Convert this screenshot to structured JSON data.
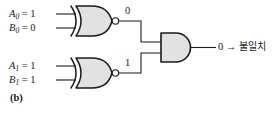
{
  "figure": {
    "panel_label": "(b)",
    "background_color": "#ffffff",
    "line_color": "#1a1a1a",
    "gate_fill_color": "#e2e2e2"
  },
  "gates": [
    {
      "id": "xnor-top",
      "type": "XNOR",
      "inputs": [
        {
          "name": "A0",
          "label_base": "A",
          "label_sub": "0",
          "eq": "=",
          "value": "1"
        },
        {
          "name": "B0",
          "label_base": "B",
          "label_sub": "0",
          "eq": "=",
          "value": "0"
        }
      ],
      "output_value": "0"
    },
    {
      "id": "xnor-bottom",
      "type": "XNOR",
      "inputs": [
        {
          "name": "A1",
          "label_base": "A",
          "label_sub": "1",
          "eq": "=",
          "value": "1"
        },
        {
          "name": "B1",
          "label_base": "B",
          "label_sub": "1",
          "eq": "=",
          "value": "1"
        }
      ],
      "output_value": "1"
    },
    {
      "id": "and-out",
      "type": "AND",
      "output_value": "0",
      "output_arrow": "→",
      "output_annotation": "불일치"
    }
  ],
  "labels": {
    "in_a0": "A",
    "in_a0_sub": "0",
    "in_a0_eq": "= 1",
    "in_b0": "B",
    "in_b0_sub": "0",
    "in_b0_eq": "= 0",
    "in_a1": "A",
    "in_a1_sub": "1",
    "in_a1_eq": "= 1",
    "in_b1": "B",
    "in_b1_sub": "1",
    "in_b1_eq": "= 1",
    "wire_top": "0",
    "wire_bottom": "1",
    "output_text": "0 → ",
    "output_korean": "불일치",
    "panel": "(b)"
  }
}
